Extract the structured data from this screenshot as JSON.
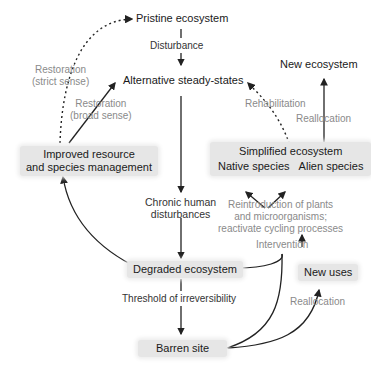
{
  "nodes": {
    "pristine": "Pristine ecosystem",
    "alternative": "Alternative steady-states",
    "improved_line1": "Improved resource",
    "improved_line2": "and species management",
    "degraded": "Degraded ecosystem",
    "barren": "Barren site",
    "new_ecosystem": "New ecosystem",
    "simplified_title": "Simplified ecosystem",
    "simplified_native": "Native species",
    "simplified_alien": "Alien species",
    "new_uses": "New uses"
  },
  "labels": {
    "disturbance": "Disturbance",
    "restoration_strict_1": "Restoration",
    "restoration_strict_2": "(strict sense)",
    "restoration_broad_1": "Restoration",
    "restoration_broad_2": "(broad sense)",
    "chronic_1": "Chronic human",
    "chronic_2": "disturbances",
    "threshold": "Threshold of irreversibility",
    "rehabilitation": "Rehabilitation",
    "reallocation_top": "Reallocation",
    "reintro_1": "Reintroduction of plants",
    "reintro_2": "and microorganisms;",
    "reintro_3": "reactivate cycling processes",
    "intervention": "Intervention",
    "reallocation_bottom": "Reallocation"
  },
  "colors": {
    "node_fill": "#e6e6e6",
    "node_text": "#1a1a1a",
    "label_text": "#8a8a8a",
    "arrow": "#222222"
  }
}
